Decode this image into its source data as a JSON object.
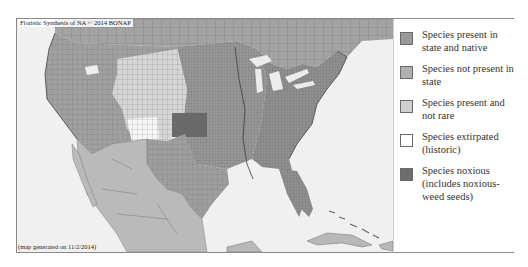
{
  "map": {
    "title": "Floristic Synthesis of NA © 2014 BONAP",
    "footer": "(map generated on 11/2/2014)",
    "colors": {
      "ocean": "#f0f0f0",
      "native": "#9a9a9a",
      "not_present": "#b0b0b0",
      "present_not_rare": "#cfcfcf",
      "extirpated": "#ffffff",
      "noxious": "#6e6e6e",
      "border": "#555555"
    }
  },
  "legend": {
    "items": [
      {
        "label": "Species present in state and native",
        "color": "#9a9a9a",
        "icon": "swatch-native"
      },
      {
        "label": "Species not present in state",
        "color": "#b0b0b0",
        "icon": "swatch-not-present"
      },
      {
        "label": "Species present and not rare",
        "color": "#cfcfcf",
        "icon": "swatch-present-not-rare"
      },
      {
        "label": "Species extirpated (historic)",
        "color": "#ffffff",
        "icon": "swatch-extirpated"
      },
      {
        "label": "Species noxious (includes noxious-weed seeds)",
        "color": "#6e6e6e",
        "icon": "swatch-noxious"
      }
    ]
  }
}
